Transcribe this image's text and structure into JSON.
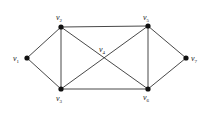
{
  "diagram": {
    "type": "graph",
    "nodes": [
      {
        "id": "v1",
        "base": "v",
        "sub": "1",
        "x": 27,
        "y": 58,
        "lx": 13,
        "ly": 61
      },
      {
        "id": "v2",
        "base": "v",
        "sub": "2",
        "x": 61,
        "y": 27,
        "lx": 56,
        "ly": 20
      },
      {
        "id": "v3",
        "base": "v",
        "sub": "3",
        "x": 61,
        "y": 89,
        "lx": 56,
        "ly": 101
      },
      {
        "id": "v4",
        "base": "v",
        "sub": "4",
        "x": 104,
        "y": 58,
        "lx": 99,
        "ly": 52
      },
      {
        "id": "v5",
        "base": "v",
        "sub": "5",
        "x": 148,
        "y": 26,
        "lx": 143,
        "ly": 20
      },
      {
        "id": "v6",
        "base": "v",
        "sub": "6",
        "x": 148,
        "y": 89,
        "lx": 143,
        "ly": 100
      },
      {
        "id": "v7",
        "base": "v",
        "sub": "7",
        "x": 186,
        "y": 58,
        "lx": 191,
        "ly": 61
      }
    ],
    "edges": [
      [
        "v1",
        "v2"
      ],
      [
        "v1",
        "v3"
      ],
      [
        "v2",
        "v3"
      ],
      [
        "v2",
        "v5"
      ],
      [
        "v2",
        "v6"
      ],
      [
        "v3",
        "v5"
      ],
      [
        "v3",
        "v6"
      ],
      [
        "v5",
        "v6"
      ],
      [
        "v5",
        "v7"
      ],
      [
        "v6",
        "v7"
      ]
    ],
    "intersection_node": "v4"
  },
  "colors": {
    "edge": "#333333",
    "node": "#111111",
    "background": "#ffffff"
  }
}
